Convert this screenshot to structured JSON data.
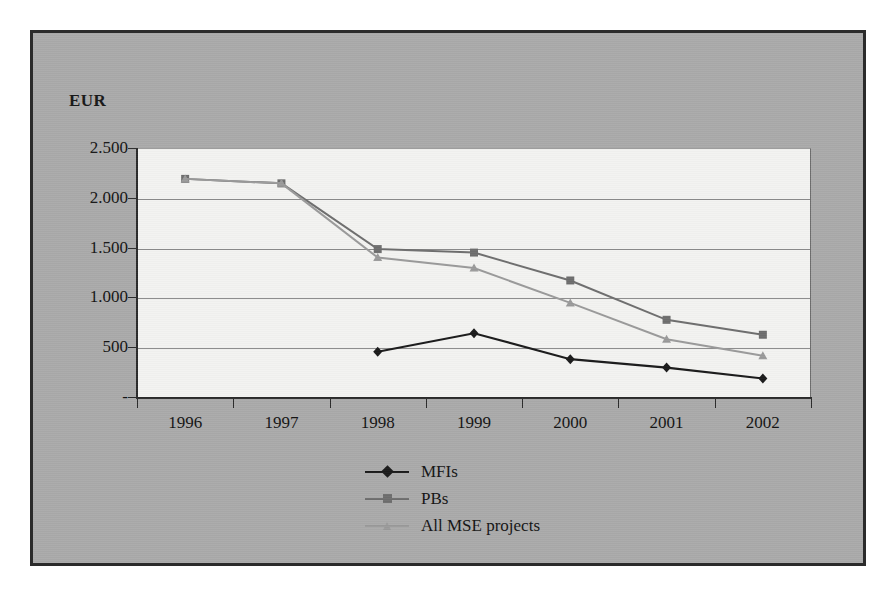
{
  "chart_data": {
    "type": "line",
    "title": "",
    "subtitle": "",
    "xlabel": "",
    "ylabel": "EUR",
    "categories": [
      "1996",
      "1997",
      "1998",
      "1999",
      "2000",
      "2001",
      "2002"
    ],
    "ytick_labels": [
      "2.500",
      "2.000",
      "1.500",
      "1.000",
      "500",
      "-"
    ],
    "ytick_values": [
      2500,
      2000,
      1500,
      1000,
      500,
      0
    ],
    "ylim": [
      0,
      2500
    ],
    "grid": true,
    "legend_position": "bottom-center",
    "series": [
      {
        "name": "MFIs",
        "color": "#1a1a1a",
        "marker": "diamond",
        "values": [
          null,
          null,
          455,
          640,
          380,
          295,
          185
        ]
      },
      {
        "name": "PBs",
        "color": "#6e6e6e",
        "marker": "square",
        "values": [
          2190,
          2145,
          1485,
          1450,
          1170,
          775,
          625
        ]
      },
      {
        "name": "All MSE projects",
        "color": "#9a9a9a",
        "marker": "triangle",
        "values": [
          2190,
          2145,
          1400,
          1295,
          945,
          580,
          415
        ]
      }
    ]
  },
  "figure": {
    "axis_title": "EUR",
    "background_color": "#aaaaaa",
    "plot_background_color": "#f3f3f1",
    "frame_color": "#2b2b2b",
    "gridline_color": "#8b8b8b"
  },
  "legend": {
    "entries": [
      {
        "label": "MFIs",
        "color": "#1a1a1a",
        "marker": "diamond"
      },
      {
        "label": "PBs",
        "color": "#6e6e6e",
        "marker": "square"
      },
      {
        "label": "All MSE projects",
        "color": "#9a9a9a",
        "marker": "triangle"
      }
    ]
  }
}
